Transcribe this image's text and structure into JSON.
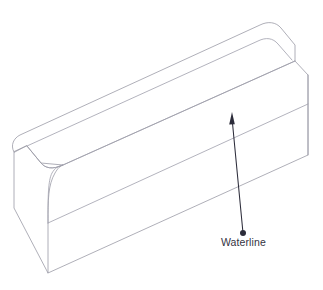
{
  "drawing": {
    "type": "isometric-line-drawing",
    "subject": "hull-block",
    "background_color": "#ffffff",
    "edge_color": "#9a9aa6",
    "feature_line_color": "#a0a0ac",
    "annotation_color": "#2c2c3a"
  },
  "annotations": [
    {
      "id": "waterline",
      "label": "Waterline",
      "icon": "leader-arrow-icon",
      "dot_x": 243,
      "dot_y": 233,
      "text_x": 221,
      "text_y": 246,
      "arrow_tip_x": 232,
      "arrow_tip_y": 112,
      "arrow_color": "#2c2c3a"
    }
  ]
}
